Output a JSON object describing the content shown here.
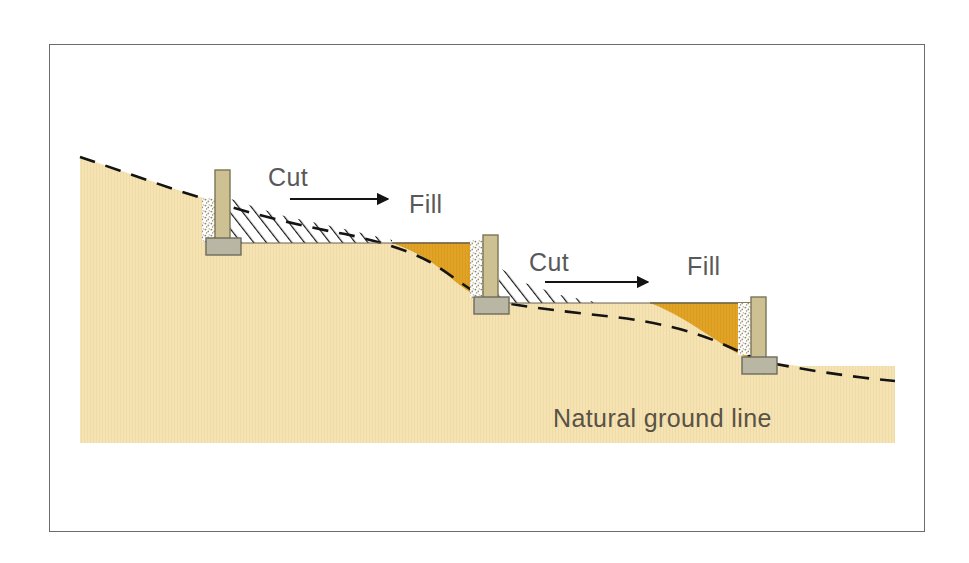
{
  "figure": {
    "type": "engineering-cross-section",
    "background_color": "#ffffff",
    "frame": {
      "border_color": "#6b6b6b",
      "x": 49,
      "y": 44,
      "width": 876,
      "height": 488
    }
  },
  "palette": {
    "natural_ground": "#f5e3b3",
    "natural_ground_edge": "#e6d39c",
    "fill_material": "#e0a326",
    "fill_material_edge": "#c98f1d",
    "wall_stem": "#cdc093",
    "wall_stem_edge": "#7d7556",
    "wall_footing": "#b9b6a4",
    "wall_footing_edge": "#6e6b5c",
    "gravel_drain": "#ffffff",
    "gravel_speck": "#8d8568",
    "hatch_line": "#1a1a1a",
    "dashed_line": "#1a1a1a",
    "arrow": "#1a1a1a",
    "label_text": "#595959"
  },
  "labels": {
    "cut_1": "Cut",
    "fill_1": "Fill",
    "cut_2": "Cut",
    "fill_2": "Fill",
    "natural_ground_line": "Natural ground line"
  },
  "annotations": {
    "arrows": [
      {
        "name": "cut-to-fill-arrow-1",
        "x1": 290,
        "y1": 199,
        "x2": 390,
        "y2": 199,
        "direction": "right"
      },
      {
        "name": "cut-to-fill-arrow-2",
        "x1": 545,
        "y1": 282,
        "x2": 650,
        "y2": 282,
        "direction": "right"
      }
    ]
  },
  "geometry": {
    "natural_ground_profile": [
      [
        80,
        157
      ],
      [
        140,
        177
      ],
      [
        200,
        197
      ],
      [
        260,
        214
      ],
      [
        320,
        229
      ],
      [
        380,
        242
      ],
      [
        430,
        256
      ],
      [
        470,
        275
      ],
      [
        500,
        292
      ],
      [
        560,
        308
      ],
      [
        620,
        320
      ],
      [
        680,
        332
      ],
      [
        740,
        348
      ],
      [
        800,
        362
      ],
      [
        860,
        374
      ],
      [
        895,
        381
      ]
    ],
    "ground_base_y": 443,
    "ground_left_x": 80,
    "ground_right_x": 895,
    "terraces": [
      {
        "name": "terrace-upper",
        "bench_y": 243,
        "left_x": 219,
        "right_x": 392
      },
      {
        "name": "terrace-middle",
        "bench_y": 303,
        "left_x": 492,
        "right_x": 722
      },
      {
        "name": "terrace-lower",
        "bench_y": 366,
        "left_x": 758,
        "right_x": 895
      }
    ],
    "walls": [
      {
        "name": "retaining-wall-1",
        "stem": {
          "x": 215,
          "y": 170,
          "w": 15,
          "h": 72
        },
        "footing": {
          "x": 206,
          "y": 238,
          "w": 35,
          "h": 17
        },
        "gravel": {
          "x": 202,
          "y": 198,
          "w": 14,
          "h": 44
        }
      },
      {
        "name": "retaining-wall-2",
        "stem": {
          "x": 483,
          "y": 235,
          "w": 15,
          "h": 66
        },
        "footing": {
          "x": 474,
          "y": 297,
          "w": 35,
          "h": 17
        },
        "gravel": {
          "x": 470,
          "y": 240,
          "w": 14,
          "h": 58
        }
      },
      {
        "name": "retaining-wall-3",
        "stem": {
          "x": 751,
          "y": 297,
          "w": 15,
          "h": 64
        },
        "footing": {
          "x": 742,
          "y": 357,
          "w": 35,
          "h": 17
        },
        "gravel": {
          "x": 738,
          "y": 303,
          "w": 14,
          "h": 52
        }
      }
    ],
    "cut_zones": [
      {
        "name": "cut-zone-1",
        "hatched": true,
        "description": "wedge of soil removed above upper bench right of wall 1"
      },
      {
        "name": "cut-zone-2",
        "hatched": true,
        "description": "wedge of soil removed above middle bench right of wall 2"
      }
    ],
    "fill_zones": [
      {
        "name": "fill-zone-1",
        "color": "#e0a326",
        "description": "material placed over natural grade behind wall 2"
      },
      {
        "name": "fill-zone-2",
        "color": "#e0a326",
        "description": "material placed over natural grade behind wall 3"
      }
    ]
  }
}
